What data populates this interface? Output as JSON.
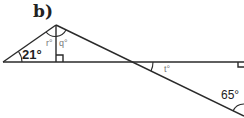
{
  "figure": {
    "part_label": "b)",
    "angles": {
      "left_base": "21°",
      "apex_left": "r°",
      "apex_right": "q°",
      "crossing": "t°",
      "bottom_right": "65°"
    },
    "markers": [
      "right-angle at foot of vertical",
      "right-angle at right end of horizontal line"
    ],
    "colors": {
      "line": "#2a2a2a",
      "small_label": "#777777",
      "background": "#ffffff"
    }
  }
}
